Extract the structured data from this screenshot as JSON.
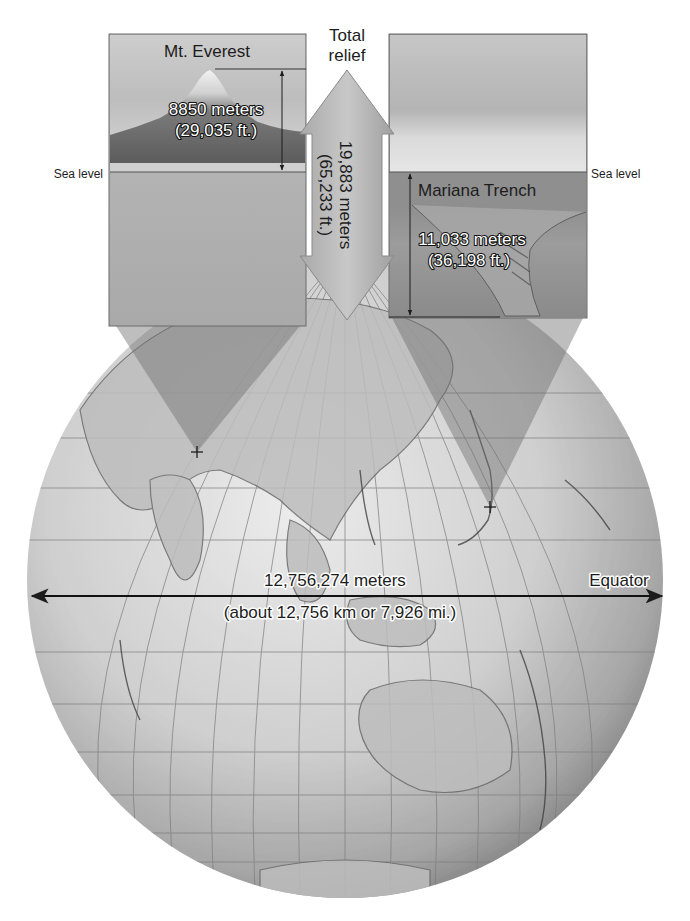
{
  "figure": {
    "colors": {
      "background": "#ffffff",
      "globe_light": "#e4e4e4",
      "globe_dark": "#8a8a8a",
      "sky": "#c9c9c9",
      "mountain": "#6e6e6e",
      "ocean_deep": "#8c8c8c",
      "arrow_fill": "#b9b9b9",
      "text": "#1c1c1c"
    }
  },
  "everest_panel": {
    "title": "Mt. Everest",
    "height_m": "8850 meters",
    "height_ft": "(29,035 ft.)",
    "sea_level_label": "Sea level"
  },
  "trench_panel": {
    "title": "Mariana Trench",
    "depth_m": "11,033 meters",
    "depth_ft": "(36,198 ft.)",
    "sea_level_label": "Sea level"
  },
  "total_relief": {
    "label_line1": "Total",
    "label_line2": "relief",
    "value_m": "19,883 meters",
    "value_ft": "(65,233 ft.)"
  },
  "globe": {
    "diameter_m": "12,756,274 meters",
    "diameter_approx": "(about 12,756 km or 7,926 mi.)",
    "equator_label": "Equator"
  }
}
